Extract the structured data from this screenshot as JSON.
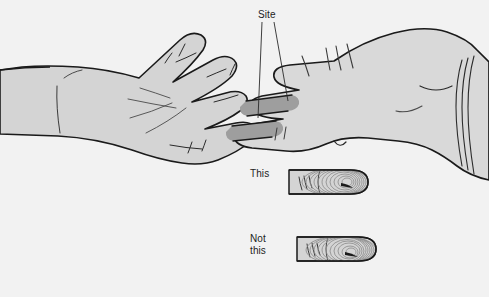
{
  "figure": {
    "type": "medical-illustration",
    "background_color": "#f2f2f2",
    "skin_fill_color": "#d4d4d4",
    "glove_fill_color": "#d9d9d9",
    "shadow_fill_color": "#9e9e9e",
    "outline_color": "#1a1a1a",
    "text_color": "#232323"
  },
  "labels": {
    "site": "Site",
    "this": "This",
    "not_this": "Not\nthis",
    "not_this_line1": "Not",
    "not_this_line2": "this"
  },
  "cut_off_text": "apposed fingertip placement",
  "leader_lines": {
    "count": 2,
    "from": "Site",
    "targets": [
      "fingertip-pad-upper",
      "fingertip-pad-lower"
    ]
  },
  "insets": [
    {
      "label": "This",
      "caption": "This",
      "correct": true,
      "description": "fingertip pad contact"
    },
    {
      "label": "Not this",
      "caption": "Not this",
      "correct": false,
      "description": "finger tip end contact"
    }
  ],
  "icons": {
    "left_hand": "open-palm-hand-icon",
    "right_hand": "gloved-hand-icon",
    "glove_cuff": "glove-cuff-icon",
    "finger_inset_correct": "finger-pad-icon",
    "finger_inset_incorrect": "finger-tip-icon"
  }
}
